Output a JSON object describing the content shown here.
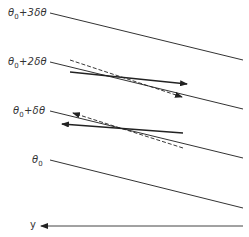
{
  "diagram": {
    "lines": [
      {
        "label_base": "θ",
        "label_sub": "0",
        "label_suffix": "+3δθ",
        "x1": 50,
        "y1": 13,
        "x2": 243,
        "y2": 60
      },
      {
        "label_base": "θ",
        "label_sub": "0",
        "label_suffix": "+2δθ",
        "x1": 50,
        "y1": 62,
        "x2": 243,
        "y2": 109
      },
      {
        "label_base": "θ",
        "label_sub": "0",
        "label_suffix": "+δθ",
        "x1": 50,
        "y1": 111,
        "x2": 243,
        "y2": 158
      },
      {
        "label_base": "θ",
        "label_sub": "0",
        "label_suffix": "",
        "x1": 50,
        "y1": 160,
        "x2": 243,
        "y2": 208
      }
    ],
    "axis": {
      "label": "y",
      "x1": 243,
      "y1": 226,
      "x2": 41,
      "y2": 226
    },
    "vectors": [
      {
        "style": "solid",
        "x1": 70,
        "y1": 72,
        "x2": 187,
        "y2": 84
      },
      {
        "style": "dashed",
        "x1": 70,
        "y1": 60,
        "x2": 182,
        "y2": 97
      },
      {
        "style": "solid",
        "x1": 183,
        "y1": 133,
        "x2": 62,
        "y2": 124
      },
      {
        "style": "dashed",
        "x1": 183,
        "y1": 148,
        "x2": 73,
        "y2": 113
      }
    ],
    "colors": {
      "line": "#333333",
      "text": "#333333"
    }
  }
}
